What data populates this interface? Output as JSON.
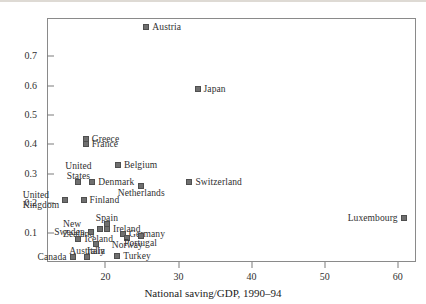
{
  "chart_data": {
    "type": "scatter",
    "title": "",
    "xlabel": "National saving/GDP, 1990–94",
    "ylabel": "",
    "xlim": [
      12.0,
      62.5
    ],
    "ylim": [
      0.0,
      0.83
    ],
    "grid": false,
    "legend": "none",
    "xticks": [
      20,
      30,
      40,
      50,
      60
    ],
    "xtick_labels": [
      "20",
      "30",
      "40",
      "50",
      "60"
    ],
    "yticks": [
      0.1,
      0.2,
      0.3,
      0.4,
      0.5,
      0.6,
      0.7
    ],
    "ytick_labels": [
      "0.1",
      "0.2",
      "0.3",
      "0.4",
      "0.5",
      "0.6",
      "0.7"
    ],
    "marker": "square",
    "marker_color": "#6f6f6f",
    "points": [
      {
        "label": "Austria",
        "x": 25.6,
        "y": 0.8,
        "label_pos": "right"
      },
      {
        "label": "Japan",
        "x": 32.6,
        "y": 0.59,
        "label_pos": "right"
      },
      {
        "label": "Greece",
        "x": 17.3,
        "y": 0.418,
        "label_pos": "right"
      },
      {
        "label": "France",
        "x": 17.3,
        "y": 0.4,
        "label_pos": "right"
      },
      {
        "label": "Belgium",
        "x": 21.7,
        "y": 0.33,
        "label_pos": "right"
      },
      {
        "label": "United\nStates",
        "x": 16.3,
        "y": 0.272,
        "label_pos": "above"
      },
      {
        "label": "Denmark",
        "x": 18.2,
        "y": 0.272,
        "label_pos": "right"
      },
      {
        "label": "Switzerland",
        "x": 31.5,
        "y": 0.272,
        "label_pos": "right"
      },
      {
        "label": "Netherlands",
        "x": 24.9,
        "y": 0.258,
        "label_pos": "below"
      },
      {
        "label": "United\nKingdom",
        "x": 14.5,
        "y": 0.212,
        "label_pos": "left"
      },
      {
        "label": "Finland",
        "x": 17.0,
        "y": 0.212,
        "label_pos": "right"
      },
      {
        "label": "Spain",
        "x": 20.2,
        "y": 0.128,
        "label_pos": "above"
      },
      {
        "label": "New\nZealand",
        "x": 19.3,
        "y": 0.112,
        "label_pos": "left"
      },
      {
        "label": "Ireland",
        "x": 20.2,
        "y": 0.112,
        "label_pos": "right"
      },
      {
        "label": "Sweden",
        "x": 18.0,
        "y": 0.103,
        "label_pos": "left"
      },
      {
        "label": "Germany",
        "x": 22.4,
        "y": 0.095,
        "label_pos": "right"
      },
      {
        "label": "Norway",
        "x": 23.0,
        "y": 0.082,
        "label_pos": "below"
      },
      {
        "label": "Portugal",
        "x": 24.8,
        "y": 0.09,
        "label_pos": "below"
      },
      {
        "label": "Iceland",
        "x": 16.3,
        "y": 0.078,
        "label_pos": "right"
      },
      {
        "label": "Italy",
        "x": 18.7,
        "y": 0.062,
        "label_pos": "below"
      },
      {
        "label": "Canada",
        "x": 15.5,
        "y": 0.018,
        "label_pos": "left"
      },
      {
        "label": "Australia",
        "x": 17.5,
        "y": 0.018,
        "label_pos": "above"
      },
      {
        "label": "Turkey",
        "x": 21.6,
        "y": 0.022,
        "label_pos": "right"
      },
      {
        "label": "Luxembourg",
        "x": 60.8,
        "y": 0.15,
        "label_pos": "left"
      }
    ]
  }
}
